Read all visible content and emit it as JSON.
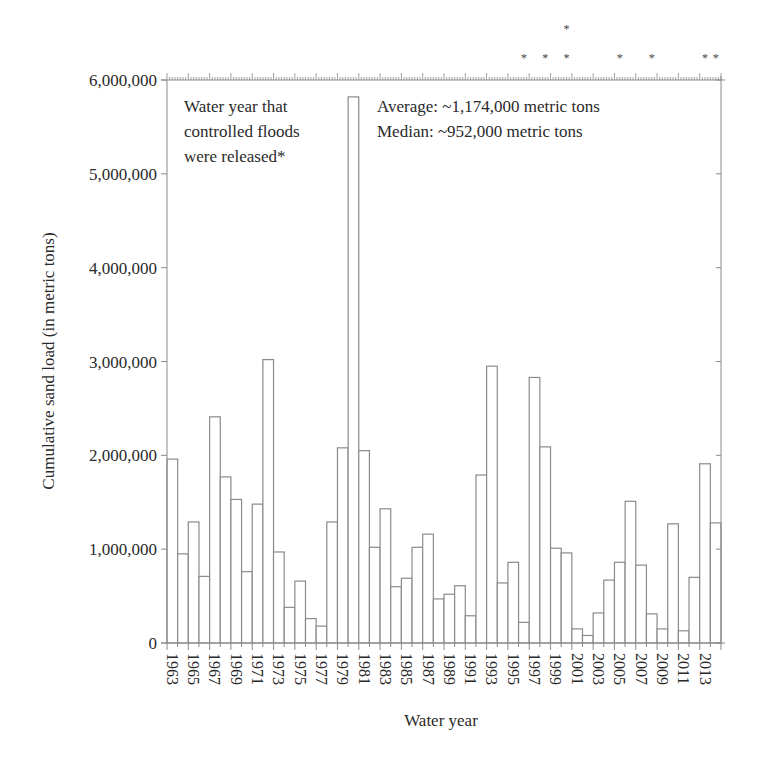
{
  "chart_data": {
    "type": "bar",
    "title": "",
    "xlabel": "Water year",
    "ylabel": "Cumulative sand load (in metric tons)",
    "ylim": [
      0,
      6000000
    ],
    "yticks": [
      0,
      1000000,
      2000000,
      3000000,
      4000000,
      5000000,
      6000000
    ],
    "ytick_labels": [
      "0",
      "1,000,000",
      "2,000,000",
      "3,000,000",
      "4,000,000",
      "5,000,000",
      "6,000,000"
    ],
    "xtick_labels": [
      "1963",
      "1965",
      "1967",
      "1969",
      "1971",
      "1973",
      "1975",
      "1977",
      "1979",
      "1981",
      "1983",
      "1985",
      "1987",
      "1989",
      "1991",
      "1993",
      "1995",
      "1997",
      "1999",
      "2001",
      "2003",
      "2005",
      "2007",
      "2009",
      "2011",
      "2013"
    ],
    "grid": false,
    "legend": null,
    "categories": [
      "1963",
      "1964",
      "1965",
      "1966",
      "1967",
      "1968",
      "1969",
      "1970",
      "1971",
      "1972",
      "1973",
      "1974",
      "1975",
      "1976",
      "1977",
      "1978",
      "1979",
      "1980",
      "1981",
      "1982",
      "1983",
      "1984",
      "1985",
      "1986",
      "1987",
      "1988",
      "1989",
      "1990",
      "1991",
      "1992",
      "1993",
      "1994",
      "1995",
      "1996",
      "1997",
      "1998",
      "1999",
      "2000",
      "2001",
      "2002",
      "2003",
      "2004",
      "2005",
      "2006",
      "2007",
      "2008",
      "2009",
      "2010",
      "2011",
      "2012",
      "2013",
      "2014"
    ],
    "values": [
      1960000,
      950000,
      1290000,
      710000,
      2410000,
      1770000,
      1530000,
      760000,
      1480000,
      3020000,
      970000,
      380000,
      660000,
      260000,
      180000,
      1290000,
      2080000,
      5820000,
      2050000,
      1020000,
      1430000,
      600000,
      690000,
      1020000,
      1160000,
      470000,
      520000,
      610000,
      290000,
      1790000,
      2950000,
      640000,
      860000,
      220000,
      2830000,
      2090000,
      1010000,
      960000,
      150000,
      80000,
      320000,
      670000,
      860000,
      1510000,
      830000,
      310000,
      150000,
      1270000,
      130000,
      700000,
      1910000,
      1280000
    ],
    "flood_markers": [
      {
        "year": "1996",
        "count": 1
      },
      {
        "year": "1998",
        "count": 1
      },
      {
        "year": "2000",
        "count": 2
      },
      {
        "year": "2005",
        "count": 1
      },
      {
        "year": "2008",
        "count": 1
      },
      {
        "year": "2013",
        "count": 1
      },
      {
        "year": "2014",
        "count": 1
      }
    ],
    "annotations": [
      "Water year that controlled floods were released*",
      "Average: ~1,174,000 metric tons",
      "Median: ~952,000 metric tons"
    ]
  },
  "annotation_left": {
    "line1": "Water year that",
    "line2": "controlled floods",
    "line3": "were released*"
  },
  "annotation_right": {
    "line1": "Average: ~1,174,000 metric tons",
    "line2": "Median: ~952,000 metric tons"
  },
  "axes": {
    "xlabel": "Water year",
    "ylabel": "Cumulative sand load (in metric tons)"
  },
  "marker_glyph": "*",
  "colors": {
    "bar_fill": "#ffffff",
    "bar_stroke": "#8a8a8a",
    "axis": "#8a8a8a",
    "text": "#2a2a2a"
  }
}
